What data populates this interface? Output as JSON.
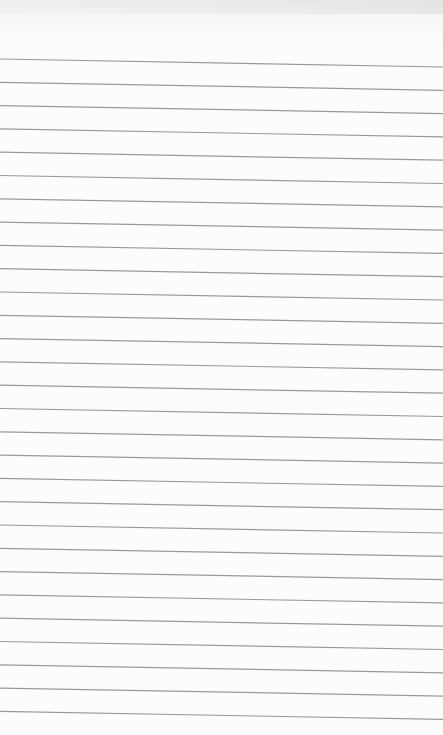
{
  "page": {
    "type": "ruled-paper",
    "paper_color": "#fcfcfc",
    "rule_color": "#9a9a9a",
    "rule_count": 29,
    "first_rule_y_left": 59,
    "first_rule_y_right": 67,
    "rule_spacing": 23.3,
    "text": ""
  }
}
